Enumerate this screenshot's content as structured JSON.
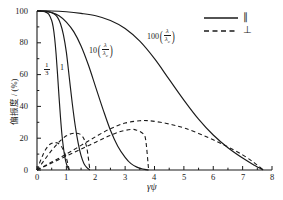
{
  "chart_data": {
    "type": "line",
    "title": "",
    "xlabel": "γψ",
    "ylabel": "偏振度 / (%)",
    "xlim": [
      0,
      8
    ],
    "ylim": [
      0,
      100
    ],
    "xticks": [
      "0",
      "1",
      "2",
      "3",
      "4",
      "5",
      "6",
      "7",
      "8"
    ],
    "yticks": [
      "0",
      "20",
      "40",
      "60",
      "80",
      "100"
    ],
    "grid": false,
    "legend_position": "top-right",
    "legend": [
      {
        "style": "solid",
        "label": "∥"
      },
      {
        "style": "dashed",
        "label": "⊥"
      }
    ],
    "annotations": [
      {
        "id": "lbl-third",
        "coef": "",
        "numerator": "1",
        "denominator": "3",
        "text": "1/3"
      },
      {
        "id": "lbl-one",
        "coef": "1",
        "text": "1"
      },
      {
        "id": "lbl-ten",
        "coef": "10",
        "numerator": "λ",
        "denominator": "λ",
        "den_sub": "c",
        "text": "10(λ/λᴄ)"
      },
      {
        "id": "lbl-hundred",
        "coef": "100",
        "numerator": "λ",
        "denominator": "λ",
        "den_sub": "c",
        "text": "100(λ/λᴄ)"
      }
    ],
    "series": [
      {
        "name": "parallel-1-3",
        "style": "solid",
        "label": "1/3",
        "x": [
          0,
          0.1,
          0.2,
          0.3,
          0.4,
          0.5,
          0.55,
          0.6,
          0.65,
          0.7,
          0.75,
          0.8,
          0.85,
          0.9,
          0.95,
          1.0,
          1.05,
          1.1
        ],
        "y": [
          100,
          100,
          99.8,
          99.3,
          98,
          94,
          90,
          83,
          73,
          60,
          46,
          33,
          22,
          14,
          8,
          4,
          1.5,
          0
        ]
      },
      {
        "name": "parallel-1",
        "style": "solid",
        "label": "1",
        "x": [
          0,
          0.2,
          0.4,
          0.6,
          0.7,
          0.8,
          0.9,
          1.0,
          1.1,
          1.2,
          1.3,
          1.4,
          1.5,
          1.6,
          1.7,
          1.8
        ],
        "y": [
          100,
          100,
          99.5,
          98,
          96,
          92,
          85,
          74,
          58,
          42,
          28,
          17,
          9,
          4,
          1.5,
          0
        ]
      },
      {
        "name": "parallel-10",
        "style": "solid",
        "label": "10(λ/λᴄ)",
        "x": [
          0,
          0.25,
          0.5,
          0.75,
          1.0,
          1.25,
          1.5,
          1.75,
          2.0,
          2.25,
          2.5,
          2.75,
          3.0,
          3.2,
          3.4,
          3.6,
          3.8
        ],
        "y": [
          100,
          99.8,
          99,
          97,
          93,
          87,
          78,
          66,
          52,
          38,
          25,
          15,
          8,
          4,
          1.8,
          0.6,
          0
        ]
      },
      {
        "name": "parallel-100",
        "style": "solid",
        "label": "100(λ/λᴄ)",
        "x": [
          0,
          0.5,
          1.0,
          1.5,
          2.0,
          2.5,
          3.0,
          3.5,
          4.0,
          4.5,
          5.0,
          5.5,
          6.0,
          6.5,
          7.0,
          7.4,
          7.7
        ],
        "y": [
          100,
          100,
          99.5,
          98.5,
          97,
          94,
          89,
          81,
          70,
          57,
          44,
          32,
          22,
          14,
          7.5,
          3,
          0
        ]
      },
      {
        "name": "perpendicular-1-3",
        "style": "dashed",
        "label": "1/3",
        "x": [
          0,
          0.1,
          0.2,
          0.3,
          0.4,
          0.5,
          0.6,
          0.7,
          0.8,
          0.9,
          1.0,
          1.1
        ],
        "y": [
          0,
          5,
          9.5,
          13,
          15.5,
          16.8,
          17.2,
          17,
          15.5,
          12.5,
          7.5,
          0
        ]
      },
      {
        "name": "perpendicular-1",
        "style": "dashed",
        "label": "1",
        "x": [
          0,
          0.2,
          0.4,
          0.6,
          0.8,
          1.0,
          1.2,
          1.4,
          1.5,
          1.6,
          1.7,
          1.8
        ],
        "y": [
          0,
          5,
          10,
          14.5,
          18.5,
          21.5,
          23,
          23,
          22,
          19.5,
          13.5,
          0
        ]
      },
      {
        "name": "perpendicular-10",
        "style": "dashed",
        "label": "10(λ/λᴄ)",
        "x": [
          0,
          0.4,
          0.8,
          1.2,
          1.6,
          2.0,
          2.4,
          2.8,
          3.2,
          3.4,
          3.6,
          3.7,
          3.8
        ],
        "y": [
          0,
          3.5,
          7,
          10.5,
          14,
          17.5,
          21,
          24,
          25.5,
          25,
          23,
          19,
          0
        ]
      },
      {
        "name": "perpendicular-100",
        "style": "dashed",
        "label": "100(λ/λᴄ)",
        "x": [
          0,
          0.5,
          1.0,
          1.5,
          2.0,
          2.5,
          3.0,
          3.5,
          3.8,
          4.2,
          4.6,
          5.0,
          5.5,
          6.0,
          6.5,
          7.0,
          7.4,
          7.7
        ],
        "y": [
          0,
          5,
          10,
          15.5,
          21,
          26,
          29.5,
          31,
          31,
          30,
          28.5,
          26.5,
          23,
          19,
          14.5,
          9.5,
          4.5,
          0
        ]
      }
    ]
  }
}
